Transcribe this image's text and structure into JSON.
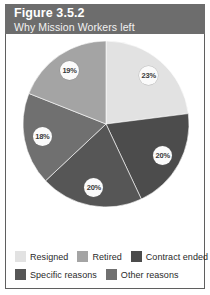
{
  "header": {
    "title": "Figure 3.5.2",
    "subtitle": "Why Mission Workers left",
    "band_color": "#6d6d6d"
  },
  "legend": {
    "rows": [
      [
        {
          "label": "Resigned",
          "color": "#e2e2e2"
        },
        {
          "label": "Retired",
          "color": "#a4a4a4"
        },
        {
          "label": "Contract ended",
          "color": "#4c4c4c"
        }
      ],
      [
        {
          "label": "Specific reasons",
          "color": "#565656"
        },
        {
          "label": "Other reasons",
          "color": "#707070"
        }
      ]
    ]
  },
  "chart_data": {
    "type": "pie",
    "title": "Figure 3.5.2",
    "subtitle": "Why Mission Workers left",
    "categories": [
      "Resigned",
      "Contract ended",
      "Specific reasons",
      "Other reasons",
      "Retired"
    ],
    "values": [
      23,
      20,
      20,
      18,
      19
    ],
    "value_labels": [
      "23%",
      "20%",
      "20%",
      "18%",
      "19%"
    ],
    "colors": [
      "#e2e2e2",
      "#4c4c4c",
      "#565656",
      "#707070",
      "#a4a4a4"
    ],
    "units": "percent",
    "total": 100,
    "start_angle_deg": 0,
    "direction": "clockwise",
    "legend_position": "bottom",
    "grid": false,
    "xlabel": "",
    "ylabel": ""
  }
}
